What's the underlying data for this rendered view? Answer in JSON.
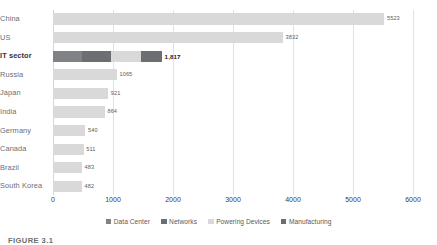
{
  "chart_data": {
    "type": "bar",
    "orientation": "horizontal",
    "stacked": true,
    "title": "",
    "subtitle": "",
    "xlabel": "",
    "ylabel": "",
    "xlim": [
      0,
      6000
    ],
    "xticks": [
      "0",
      "1000",
      "2000",
      "3000",
      "4000",
      "5000",
      "6000"
    ],
    "xtick_values": [
      0,
      1000,
      2000,
      3000,
      4000,
      5000,
      6000
    ],
    "grid": true,
    "legend_position": "bottom",
    "categories": [
      "China",
      "US",
      "IT sector",
      "Russia",
      "Japan",
      "India",
      "Germany",
      "Canada",
      "Brazil",
      "South Korea"
    ],
    "highlight_category": "IT sector",
    "totals": [
      5523,
      3832,
      1817,
      1065,
      921,
      864,
      540,
      511,
      483,
      482
    ],
    "value_labels": [
      "5523",
      "3832",
      "1,817",
      "1065",
      "921",
      "864",
      "540",
      "511",
      "483",
      "482"
    ],
    "series": [
      {
        "name": "Data Center",
        "color": "#808285",
        "values": [
          0,
          0,
          480,
          0,
          0,
          0,
          0,
          0,
          0,
          0
        ]
      },
      {
        "name": "Networks",
        "color": "#6d6e71",
        "values": [
          0,
          0,
          480,
          0,
          0,
          0,
          0,
          0,
          0,
          0
        ]
      },
      {
        "name": "Powering Devices",
        "color": "#d9d9d9",
        "values": [
          5523,
          3832,
          505,
          1065,
          921,
          864,
          540,
          511,
          483,
          482
        ]
      },
      {
        "name": "Manufacturing",
        "color": "#6d6e71",
        "values": [
          0,
          0,
          352,
          0,
          0,
          0,
          0,
          0,
          0,
          0
        ]
      }
    ],
    "bars": [
      {
        "category": "China",
        "label": "5523",
        "total": 5523,
        "segments": [
          {
            "series": "Powering Devices",
            "value": 5523
          }
        ]
      },
      {
        "category": "US",
        "label": "3832",
        "total": 3832,
        "segments": [
          {
            "series": "Powering Devices",
            "value": 3832
          }
        ]
      },
      {
        "category": "IT sector",
        "label": "1,817",
        "total": 1817,
        "segments": [
          {
            "series": "Data Center",
            "value": 480
          },
          {
            "series": "Networks",
            "value": 480
          },
          {
            "series": "Powering Devices",
            "value": 505
          },
          {
            "series": "Manufacturing",
            "value": 352
          }
        ]
      },
      {
        "category": "Russia",
        "label": "1065",
        "total": 1065,
        "segments": [
          {
            "series": "Powering Devices",
            "value": 1065
          }
        ]
      },
      {
        "category": "Japan",
        "label": "921",
        "total": 921,
        "segments": [
          {
            "series": "Powering Devices",
            "value": 921
          }
        ]
      },
      {
        "category": "India",
        "label": "864",
        "total": 864,
        "segments": [
          {
            "series": "Powering Devices",
            "value": 864
          }
        ]
      },
      {
        "category": "Germany",
        "label": "540",
        "total": 540,
        "segments": [
          {
            "series": "Powering Devices",
            "value": 540
          }
        ]
      },
      {
        "category": "Canada",
        "label": "511",
        "total": 511,
        "segments": [
          {
            "series": "Powering Devices",
            "value": 511
          }
        ]
      },
      {
        "category": "Brazil",
        "label": "483",
        "total": 483,
        "segments": [
          {
            "series": "Powering Devices",
            "value": 483
          }
        ]
      },
      {
        "category": "South Korea",
        "label": "482",
        "total": 482,
        "segments": [
          {
            "series": "Powering Devices",
            "value": 482
          }
        ]
      }
    ],
    "legend": [
      {
        "label": "Data Center",
        "color": "#808285"
      },
      {
        "label": "Networks",
        "color": "#6d6e71"
      },
      {
        "label": "Powering Devices",
        "color": "#d9d9d9"
      },
      {
        "label": "Manufacturing",
        "color": "#6d6e71"
      }
    ]
  },
  "caption": {
    "text": "FIGURE 3.1"
  },
  "colors": {
    "gridline": "#e2e2e2",
    "axis_text": "#404041",
    "category_text": "#6d6e71",
    "value_text": "#5b5c5e",
    "background": "#ffffff"
  }
}
